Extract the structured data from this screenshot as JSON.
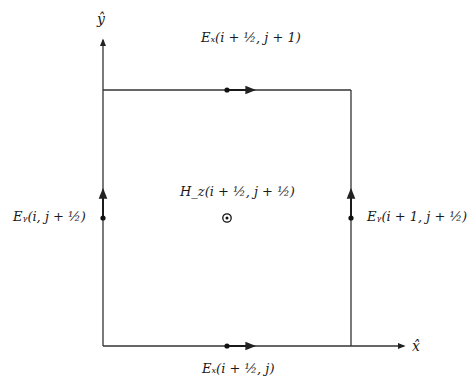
{
  "figure": {
    "type": "Yee cell (2D FDTD TE grid cell)",
    "axes": {
      "x_label": "x̂",
      "y_label": "ŷ"
    },
    "field_components": [
      {
        "id": "ex-top",
        "label": "Eₓ(i + ½, j + 1)",
        "symbol": "E_x",
        "index": "(i + 1/2, j + 1)",
        "direction": "+x",
        "edge": "top"
      },
      {
        "id": "ex-bottom",
        "label": "Eₓ(i + ½, j)",
        "symbol": "E_x",
        "index": "(i + 1/2, j)",
        "direction": "+x",
        "edge": "bottom"
      },
      {
        "id": "ey-left",
        "label": "Eᵧ(i, j + ½)",
        "symbol": "E_y",
        "index": "(i, j + 1/2)",
        "direction": "+y",
        "edge": "left"
      },
      {
        "id": "ey-right",
        "label": "Eᵧ(i + 1, j + ½)",
        "symbol": "E_y",
        "index": "(i + 1, j + 1/2)",
        "direction": "+y",
        "edge": "right"
      },
      {
        "id": "hz-center",
        "label": "H_z(i + ½, j + ½)",
        "symbol": "H_z",
        "index": "(i + 1/2, j + 1/2)",
        "direction": "out-of-page",
        "edge": "center"
      }
    ],
    "colors": {
      "line": "#333333",
      "text": "#1a1a1a",
      "background": "#ffffff"
    }
  }
}
